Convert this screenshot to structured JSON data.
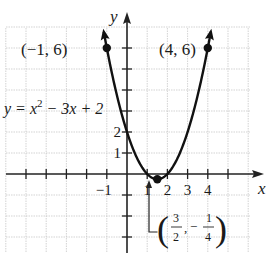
{
  "chart_data": {
    "type": "line",
    "title": "",
    "function": "y = x^2 - 3x + 2",
    "equation_label": {
      "lhs": "y = x",
      "exp": "2",
      "rhs": " − 3x + 2"
    },
    "xlabel": "x",
    "ylabel": "y",
    "xlim": [
      -6,
      6.5
    ],
    "ylim": [
      -4,
      7.5
    ],
    "grid": true,
    "x_tick_labels": [
      {
        "value": -1,
        "label": "−1"
      },
      {
        "value": 1,
        "label": "1"
      },
      {
        "value": 2,
        "label": "2"
      },
      {
        "value": 3,
        "label": "3"
      },
      {
        "value": 4,
        "label": "4"
      }
    ],
    "y_tick_labels": [
      {
        "value": 1,
        "label": "1"
      },
      {
        "value": 2,
        "label": "2"
      }
    ],
    "x_ticks": [
      -5,
      -4,
      -3,
      -2,
      -1,
      1,
      2,
      3,
      4,
      5
    ],
    "y_ticks": [
      -3,
      -2,
      -1,
      1,
      2,
      3,
      4,
      5,
      6
    ],
    "curve_domain": [
      -1.15,
      4.15
    ],
    "points": [
      {
        "x": -1,
        "y": 6,
        "label": "(−1, 6)"
      },
      {
        "x": 4,
        "y": 6,
        "label": "(4, 6)"
      },
      {
        "x": 1.5,
        "y": -0.25,
        "label": "vertex"
      }
    ],
    "vertex_annotation": {
      "num1": "3",
      "den1": "2",
      "sep": ",",
      "neg": "−",
      "num2": "1",
      "den2": "4"
    },
    "colors": {
      "curve": "#111111",
      "grid": "#c8c8c8",
      "axis": "#222222"
    }
  }
}
